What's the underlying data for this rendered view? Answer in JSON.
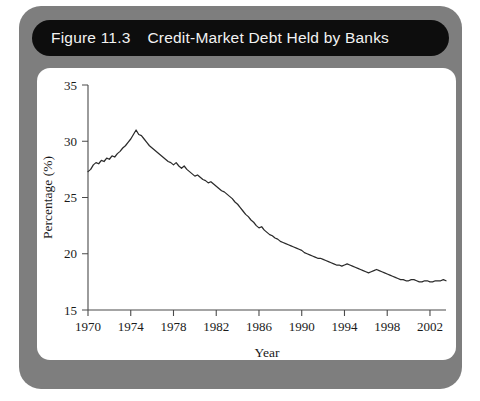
{
  "figure": {
    "number": "Figure 11.3",
    "title": "Credit-Market Debt Held by Banks"
  },
  "colors": {
    "outer_panel": "#7e7e7e",
    "title_banner": "#0d0d0d",
    "title_text": "#f2f2f2",
    "plot_card": "#ffffff",
    "line": "#2b2b2b",
    "axis": "#4a4a4a"
  },
  "chart_data": {
    "type": "line",
    "title": "Credit-Market Debt Held by Banks",
    "subtitle": "",
    "xlabel": "Year",
    "ylabel": "Percentage (%)",
    "xlim": [
      1970,
      2003.5
    ],
    "ylim": [
      15,
      35
    ],
    "grid": false,
    "legend": "none",
    "x_ticks": [
      1970,
      1974,
      1978,
      1982,
      1986,
      1990,
      1994,
      1998,
      2002
    ],
    "x_tick_labels": [
      "1970",
      "1974",
      "1978",
      "1982",
      "1986",
      "1990",
      "1994",
      "1998",
      "2002"
    ],
    "y_ticks": [
      15,
      20,
      25,
      30,
      35
    ],
    "y_tick_labels": [
      "15",
      "20",
      "25",
      "30",
      "35"
    ],
    "series": [
      {
        "name": "Credit-Market Debt Held by Banks",
        "x": [
          1970.0,
          1970.25,
          1970.5,
          1970.75,
          1971.0,
          1971.25,
          1971.5,
          1971.75,
          1972.0,
          1972.25,
          1972.5,
          1972.75,
          1973.0,
          1973.25,
          1973.5,
          1973.75,
          1974.0,
          1974.25,
          1974.5,
          1974.75,
          1975.0,
          1975.25,
          1975.5,
          1975.75,
          1976.0,
          1976.25,
          1976.5,
          1976.75,
          1977.0,
          1977.25,
          1977.5,
          1977.75,
          1978.0,
          1978.25,
          1978.5,
          1978.75,
          1979.0,
          1979.25,
          1979.5,
          1979.75,
          1980.0,
          1980.25,
          1980.5,
          1980.75,
          1981.0,
          1981.25,
          1981.5,
          1981.75,
          1982.0,
          1982.25,
          1982.5,
          1982.75,
          1983.0,
          1983.25,
          1983.5,
          1983.75,
          1984.0,
          1984.25,
          1984.5,
          1984.75,
          1985.0,
          1985.25,
          1985.5,
          1985.75,
          1986.0,
          1986.25,
          1986.5,
          1986.75,
          1987.0,
          1987.25,
          1987.5,
          1987.75,
          1988.0,
          1988.25,
          1988.5,
          1988.75,
          1989.0,
          1989.25,
          1989.5,
          1989.75,
          1990.0,
          1990.25,
          1990.5,
          1990.75,
          1991.0,
          1991.25,
          1991.5,
          1991.75,
          1992.0,
          1992.25,
          1992.5,
          1992.75,
          1993.0,
          1993.25,
          1993.5,
          1993.75,
          1994.0,
          1994.25,
          1994.5,
          1994.75,
          1995.0,
          1995.25,
          1995.5,
          1995.75,
          1996.0,
          1996.25,
          1996.5,
          1996.75,
          1997.0,
          1997.25,
          1997.5,
          1997.75,
          1998.0,
          1998.25,
          1998.5,
          1998.75,
          1999.0,
          1999.25,
          1999.5,
          1999.75,
          2000.0,
          2000.25,
          2000.5,
          2000.75,
          2001.0,
          2001.25,
          2001.5,
          2001.75,
          2002.0,
          2002.25,
          2002.5,
          2002.75,
          2003.0,
          2003.25,
          2003.5
        ],
        "y": [
          27.3,
          27.5,
          27.9,
          28.1,
          28.0,
          28.3,
          28.2,
          28.5,
          28.4,
          28.7,
          28.6,
          28.9,
          29.1,
          29.4,
          29.6,
          29.9,
          30.2,
          30.6,
          31.0,
          30.6,
          30.5,
          30.2,
          29.9,
          29.6,
          29.4,
          29.2,
          29.0,
          28.8,
          28.6,
          28.4,
          28.2,
          28.1,
          27.9,
          28.1,
          27.8,
          27.6,
          27.8,
          27.5,
          27.3,
          27.1,
          26.9,
          27.0,
          26.8,
          26.6,
          26.5,
          26.3,
          26.4,
          26.2,
          26.0,
          25.8,
          25.6,
          25.5,
          25.3,
          25.1,
          24.9,
          24.6,
          24.4,
          24.1,
          23.8,
          23.5,
          23.3,
          23.0,
          22.8,
          22.5,
          22.3,
          22.4,
          22.1,
          21.9,
          21.7,
          21.6,
          21.4,
          21.3,
          21.1,
          21.0,
          20.9,
          20.8,
          20.7,
          20.6,
          20.5,
          20.4,
          20.3,
          20.1,
          20.0,
          19.9,
          19.8,
          19.7,
          19.6,
          19.6,
          19.5,
          19.4,
          19.3,
          19.2,
          19.1,
          19.0,
          19.0,
          18.9,
          19.0,
          19.1,
          19.0,
          18.9,
          18.8,
          18.7,
          18.6,
          18.5,
          18.4,
          18.3,
          18.4,
          18.5,
          18.6,
          18.5,
          18.4,
          18.3,
          18.2,
          18.1,
          18.0,
          17.9,
          17.8,
          17.7,
          17.7,
          17.6,
          17.6,
          17.7,
          17.7,
          17.6,
          17.5,
          17.5,
          17.6,
          17.6,
          17.5,
          17.5,
          17.6,
          17.6,
          17.6,
          17.7,
          17.6
        ]
      }
    ]
  }
}
